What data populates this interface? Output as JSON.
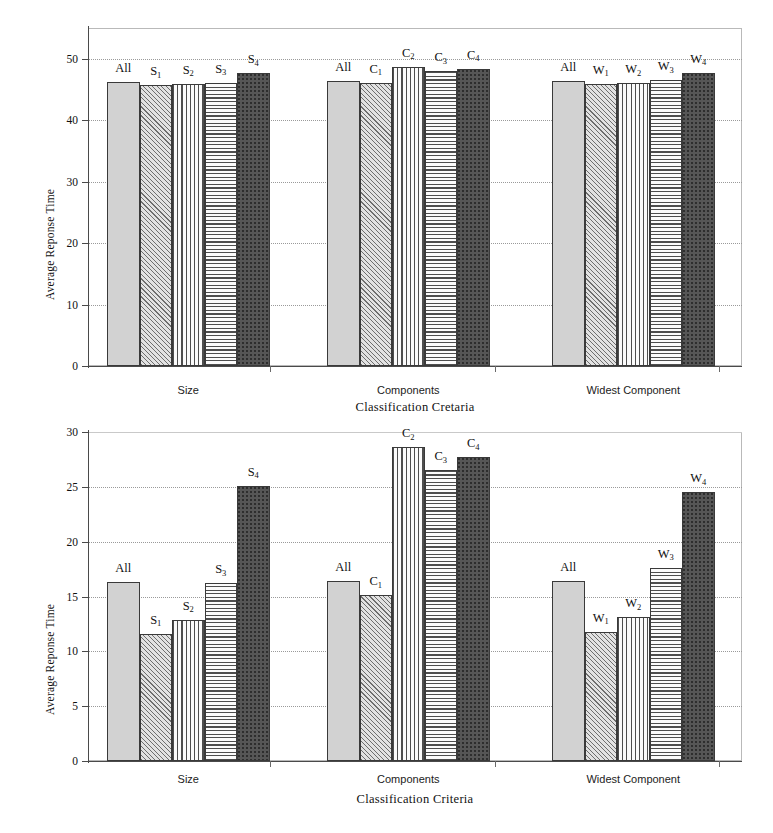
{
  "figure": {
    "panel_count": 2
  },
  "chart_data": [
    {
      "id": "top",
      "type": "bar",
      "title": "",
      "xlabel": "Classification Cretaria",
      "ylabel": "Average Reponse Time",
      "ylim": [
        0,
        55
      ],
      "yticks": [
        0,
        10,
        20,
        30,
        40,
        50
      ],
      "ytick_labels": [
        "0",
        "10",
        "20",
        "30",
        "40",
        "50"
      ],
      "grid": true,
      "legend": "none",
      "categories": [
        "Size",
        "Components",
        "Widest Component"
      ],
      "groups": [
        {
          "category": "Size",
          "bars": [
            {
              "label": "All",
              "sub": "",
              "value": 46.2,
              "pattern": "stipple"
            },
            {
              "label": "S",
              "sub": "1",
              "value": 45.7,
              "pattern": "diag"
            },
            {
              "label": "S",
              "sub": "2",
              "value": 45.9,
              "pattern": "vert"
            },
            {
              "label": "S",
              "sub": "3",
              "value": 46.1,
              "pattern": "horiz"
            },
            {
              "label": "S",
              "sub": "4",
              "value": 47.6,
              "pattern": "dark"
            }
          ]
        },
        {
          "category": "Components",
          "bars": [
            {
              "label": "All",
              "sub": "",
              "value": 46.3,
              "pattern": "stipple"
            },
            {
              "label": "C",
              "sub": "1",
              "value": 46.1,
              "pattern": "diag"
            },
            {
              "label": "C",
              "sub": "2",
              "value": 48.7,
              "pattern": "vert"
            },
            {
              "label": "C",
              "sub": "3",
              "value": 48.0,
              "pattern": "horiz"
            },
            {
              "label": "C",
              "sub": "4",
              "value": 48.4,
              "pattern": "dark"
            }
          ]
        },
        {
          "category": "Widest Component",
          "bars": [
            {
              "label": "All",
              "sub": "",
              "value": 46.4,
              "pattern": "stipple"
            },
            {
              "label": "W",
              "sub": "1",
              "value": 45.9,
              "pattern": "diag"
            },
            {
              "label": "W",
              "sub": "2",
              "value": 46.0,
              "pattern": "vert"
            },
            {
              "label": "W",
              "sub": "3",
              "value": 46.5,
              "pattern": "horiz"
            },
            {
              "label": "W",
              "sub": "4",
              "value": 47.7,
              "pattern": "dark"
            }
          ]
        }
      ]
    },
    {
      "id": "bottom",
      "type": "bar",
      "title": "",
      "xlabel": "Classification Criteria",
      "ylabel": "Average Reponse Time",
      "ylim": [
        0,
        30
      ],
      "yticks": [
        0,
        5,
        10,
        15,
        20,
        25,
        30
      ],
      "ytick_labels": [
        "0",
        "5",
        "10",
        "15",
        "20",
        "25",
        "30"
      ],
      "grid": true,
      "legend": "none",
      "categories": [
        "Size",
        "Components",
        "Widest Component"
      ],
      "groups": [
        {
          "category": "Size",
          "bars": [
            {
              "label": "All",
              "sub": "",
              "value": 16.3,
              "pattern": "stipple"
            },
            {
              "label": "S",
              "sub": "1",
              "value": 11.6,
              "pattern": "diag"
            },
            {
              "label": "S",
              "sub": "2",
              "value": 12.9,
              "pattern": "vert"
            },
            {
              "label": "S",
              "sub": "3",
              "value": 16.2,
              "pattern": "horiz"
            },
            {
              "label": "S",
              "sub": "4",
              "value": 25.1,
              "pattern": "dark"
            }
          ]
        },
        {
          "category": "Components",
          "bars": [
            {
              "label": "All",
              "sub": "",
              "value": 16.4,
              "pattern": "stipple"
            },
            {
              "label": "C",
              "sub": "1",
              "value": 15.1,
              "pattern": "diag"
            },
            {
              "label": "C",
              "sub": "2",
              "value": 28.6,
              "pattern": "vert"
            },
            {
              "label": "C",
              "sub": "3",
              "value": 26.5,
              "pattern": "horiz"
            },
            {
              "label": "C",
              "sub": "4",
              "value": 27.7,
              "pattern": "dark"
            }
          ]
        },
        {
          "category": "Widest Component",
          "bars": [
            {
              "label": "All",
              "sub": "",
              "value": 16.4,
              "pattern": "stipple"
            },
            {
              "label": "W",
              "sub": "1",
              "value": 11.8,
              "pattern": "diag"
            },
            {
              "label": "W",
              "sub": "2",
              "value": 13.1,
              "pattern": "vert"
            },
            {
              "label": "W",
              "sub": "3",
              "value": 17.6,
              "pattern": "horiz"
            },
            {
              "label": "W",
              "sub": "4",
              "value": 24.5,
              "pattern": "dark"
            }
          ]
        }
      ]
    }
  ]
}
